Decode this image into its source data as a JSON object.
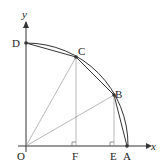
{
  "diagram": {
    "axes": {
      "x_label": "x",
      "y_label": "y"
    },
    "points": {
      "O": {
        "label": "O",
        "x": 26,
        "y": 146
      },
      "A": {
        "label": "A",
        "x": 127,
        "y": 146
      },
      "B": {
        "label": "B",
        "x": 114,
        "y": 95
      },
      "C": {
        "label": "C",
        "x": 76,
        "y": 57
      },
      "D": {
        "label": "D",
        "x": 26,
        "y": 43
      },
      "E": {
        "label": "E",
        "x": 114,
        "y": 146
      },
      "F": {
        "label": "F",
        "x": 76,
        "y": 146
      }
    },
    "colors": {
      "line": "#333333",
      "thin": "#777777",
      "background": "#ffffff"
    }
  }
}
